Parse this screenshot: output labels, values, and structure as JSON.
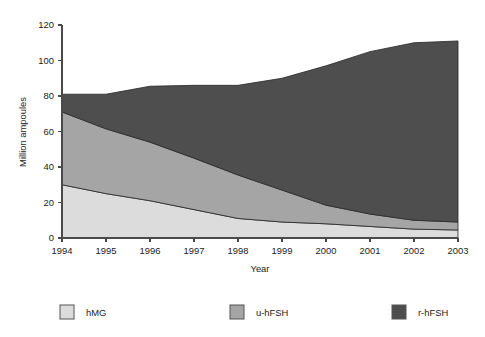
{
  "chart_data": {
    "type": "area",
    "stacked": true,
    "title": "",
    "subtitle": "",
    "xlabel": "Year",
    "ylabel": "Million ampoules",
    "categories": [
      "1994",
      "1995",
      "1996",
      "1997",
      "1998",
      "1999",
      "2000",
      "2001",
      "2002",
      "2003"
    ],
    "x": [
      1994,
      1995,
      1996,
      1997,
      1998,
      1999,
      2000,
      2001,
      2002,
      2003
    ],
    "xlim": [
      1994,
      2003
    ],
    "ylim": [
      0,
      120
    ],
    "yticks": [
      0,
      20,
      40,
      60,
      80,
      100,
      120
    ],
    "ytick_labels": [
      "0",
      "20",
      "40",
      "60",
      "80",
      "100",
      "120"
    ],
    "grid": false,
    "legend_position": "bottom",
    "series": [
      {
        "name": "hMG",
        "color": "#dcdcdc",
        "values": [
          30,
          25,
          21,
          16,
          11,
          9,
          8,
          6.5,
          5,
          4.5
        ]
      },
      {
        "name": "u-hFSH",
        "color": "#a5a5a5",
        "values": [
          41,
          36.5,
          33,
          29,
          24.5,
          18,
          10.5,
          7,
          5,
          4.5
        ]
      },
      {
        "name": "r-hFSH",
        "color": "#4e4e4e",
        "values": [
          10,
          19.5,
          31.5,
          41,
          50.5,
          63,
          78.5,
          91.5,
          100,
          102
        ]
      }
    ],
    "stack_totals": [
      81,
      81,
      85.5,
      86,
      86,
      90,
      97,
      105,
      110,
      111
    ],
    "annotations": []
  },
  "legend": {
    "items": [
      {
        "label": "hMG",
        "color": "#dcdcdc"
      },
      {
        "label": "u-hFSH",
        "color": "#a5a5a5"
      },
      {
        "label": "r-hFSH",
        "color": "#4e4e4e"
      }
    ]
  },
  "axes": {
    "y_title": "Million ampoules",
    "x_title": "Year"
  }
}
